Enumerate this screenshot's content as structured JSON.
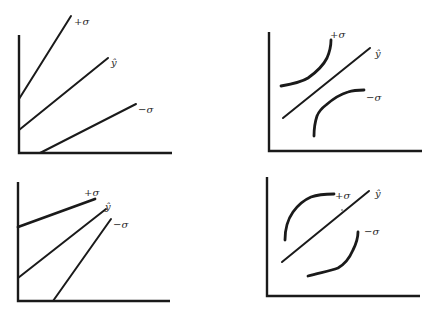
{
  "figure": {
    "panels": [
      {
        "id": "top-left",
        "curves": [
          {
            "label": "+σ",
            "kind": "line"
          },
          {
            "label": "ŷ",
            "kind": "line"
          },
          {
            "label": "−σ",
            "kind": "line"
          }
        ]
      },
      {
        "id": "top-right",
        "curves": [
          {
            "label": "+σ",
            "kind": "curve"
          },
          {
            "label": "ŷ",
            "kind": "line"
          },
          {
            "label": "−σ",
            "kind": "curve"
          }
        ]
      },
      {
        "id": "bottom-left",
        "curves": [
          {
            "label": "+σ",
            "kind": "line"
          },
          {
            "label": "ŷ",
            "kind": "line"
          },
          {
            "label": "−σ",
            "kind": "line"
          }
        ]
      },
      {
        "id": "bottom-right",
        "curves": [
          {
            "label": "+σ",
            "kind": "curve"
          },
          {
            "label": "ŷ",
            "kind": "line"
          },
          {
            "label": "−σ",
            "kind": "curve"
          }
        ]
      }
    ]
  }
}
